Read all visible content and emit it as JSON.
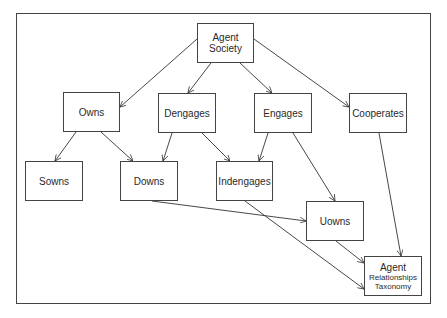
{
  "diagram": {
    "title": "Agent Relationships Taxonomy",
    "nodes": [
      {
        "id": "agent_society",
        "lines": [
          "Agent",
          "Society"
        ],
        "x": 197,
        "y": 23,
        "w": 57,
        "h": 40
      },
      {
        "id": "owns",
        "lines": [
          "Owns"
        ],
        "x": 63,
        "y": 92,
        "w": 57,
        "h": 40
      },
      {
        "id": "dengages",
        "lines": [
          "Dengages"
        ],
        "x": 158,
        "y": 93,
        "w": 58,
        "h": 40
      },
      {
        "id": "engages",
        "lines": [
          "Engages"
        ],
        "x": 254,
        "y": 93,
        "w": 58,
        "h": 40
      },
      {
        "id": "cooperates",
        "lines": [
          "Cooperates"
        ],
        "x": 349,
        "y": 93,
        "w": 58,
        "h": 40
      },
      {
        "id": "sowns",
        "lines": [
          "Sowns"
        ],
        "x": 25,
        "y": 161,
        "w": 58,
        "h": 40
      },
      {
        "id": "downs",
        "lines": [
          "Downs"
        ],
        "x": 120,
        "y": 161,
        "w": 58,
        "h": 40
      },
      {
        "id": "indengages",
        "lines": [
          "Indengages"
        ],
        "x": 216,
        "y": 161,
        "w": 57,
        "h": 40
      },
      {
        "id": "uowns",
        "lines": [
          "Uowns"
        ],
        "x": 306,
        "y": 201,
        "w": 58,
        "h": 40
      },
      {
        "id": "agent_relationships_taxonomy",
        "lines": [
          "Agent",
          "Relationships",
          "Taxonomy"
        ],
        "x": 364,
        "y": 256,
        "w": 58,
        "h": 40
      }
    ],
    "edges": [
      {
        "from": "agent_society",
        "to": "owns"
      },
      {
        "from": "agent_society",
        "to": "dengages"
      },
      {
        "from": "agent_society",
        "to": "engages"
      },
      {
        "from": "agent_society",
        "to": "cooperates"
      },
      {
        "from": "owns",
        "to": "sowns"
      },
      {
        "from": "owns",
        "to": "downs"
      },
      {
        "from": "dengages",
        "to": "downs"
      },
      {
        "from": "dengages",
        "to": "indengages"
      },
      {
        "from": "engages",
        "to": "indengages"
      },
      {
        "from": "engages",
        "to": "uowns"
      },
      {
        "from": "cooperates",
        "to": "agent_relationships_taxonomy"
      },
      {
        "from": "downs",
        "to": "uowns"
      },
      {
        "from": "indengages",
        "to": "agent_relationships_taxonomy"
      },
      {
        "from": "uowns",
        "to": "agent_relationships_taxonomy"
      }
    ]
  },
  "labels": {
    "agent_society_1": "Agent",
    "agent_society_2": "Society",
    "owns": "Owns",
    "dengages": "Dengages",
    "engages": "Engages",
    "cooperates": "Cooperates",
    "sowns": "Sowns",
    "downs": "Downs",
    "indengages": "Indengages",
    "uowns": "Uowns",
    "art_1": "Agent",
    "art_2": "Relationships",
    "art_3": "Taxonomy"
  }
}
